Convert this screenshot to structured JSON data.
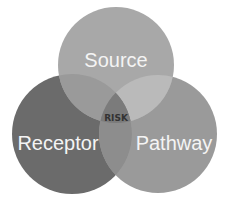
{
  "diagram": {
    "type": "venn",
    "circles": [
      {
        "id": "source",
        "label": "Source",
        "color": "#a7a7a7"
      },
      {
        "id": "receptor",
        "label": "Receptor",
        "color": "#6b6b6b"
      },
      {
        "id": "pathway",
        "label": "Pathway",
        "color": "#999999"
      }
    ],
    "overlaps": {
      "source_receptor": "#8f8f8f",
      "source_pathway": "#b9b9b9",
      "receptor_pathway": "#8a8a8a"
    },
    "center": {
      "label": "RISK",
      "color": "#777777"
    }
  }
}
